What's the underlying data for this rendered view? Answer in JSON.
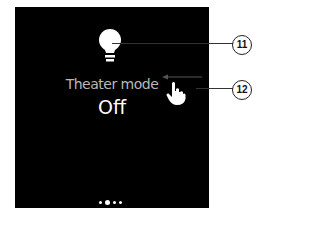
{
  "tile": {
    "title": "Theater mode",
    "value": "Off",
    "icon": "lightbulb-icon"
  },
  "pagination": {
    "count": 4,
    "active_index": 1
  },
  "callouts": [
    {
      "label": "11",
      "target": "lightbulb-icon"
    },
    {
      "label": "12",
      "target": "swipe-left-gesture"
    }
  ],
  "gesture": {
    "icon": "hand-pointer-icon",
    "direction": "left"
  },
  "colors": {
    "screen_bg": "#000000",
    "title": "#b8b8b8",
    "value": "#ffffff"
  }
}
